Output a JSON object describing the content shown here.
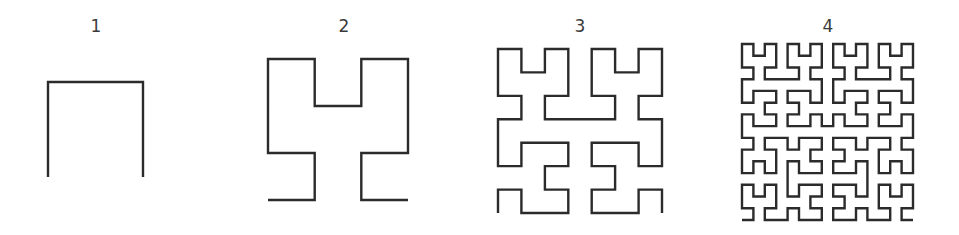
{
  "figure": {
    "stroke_color": "#2b2b2b",
    "label_color": "#3a3a3a",
    "panels": [
      {
        "label": "1",
        "order": 1,
        "label_x": 96,
        "label_y": 32,
        "left": 48,
        "top": 82,
        "right": 143,
        "bottom": 177
      },
      {
        "label": "2",
        "order": 2,
        "label_x": 344,
        "label_y": 32,
        "left": 268,
        "top": 59,
        "right": 408,
        "bottom": 200
      },
      {
        "label": "3",
        "order": 3,
        "label_x": 580,
        "label_y": 32,
        "left": 498,
        "top": 49,
        "right": 662,
        "bottom": 213
      },
      {
        "label": "4",
        "order": 4,
        "label_x": 828,
        "label_y": 32,
        "left": 742,
        "top": 44,
        "right": 913,
        "bottom": 220
      }
    ]
  }
}
